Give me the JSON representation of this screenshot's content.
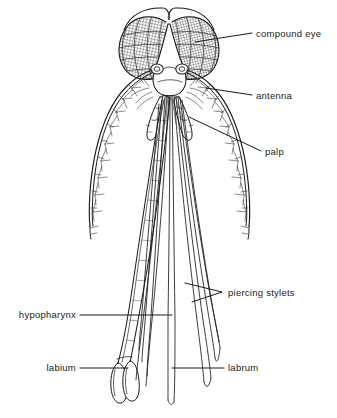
{
  "figure": {
    "background_color": "#ffffff",
    "ink_color": "#1a1a1a",
    "width": 337,
    "height": 418
  },
  "labels": {
    "compound_eye": "compound eye",
    "antenna": "antenna",
    "palp": "palp",
    "piercing_stylets": "piercing stylets",
    "hypopharynx": "hypopharynx",
    "labium": "labium",
    "labrum": "labrum"
  },
  "parts": [
    {
      "key": "compound_eye",
      "label": "compound eye",
      "side": "right",
      "text_x": 256,
      "text_y": 37,
      "align": "start"
    },
    {
      "key": "antenna",
      "label": "antenna",
      "side": "right",
      "text_x": 256,
      "text_y": 99,
      "align": "start"
    },
    {
      "key": "palp",
      "label": "palp",
      "side": "right",
      "text_x": 265,
      "text_y": 155,
      "align": "start"
    },
    {
      "key": "piercing_stylets",
      "label": "piercing stylets",
      "side": "right",
      "text_x": 228,
      "text_y": 295,
      "align": "start"
    },
    {
      "key": "hypopharynx",
      "label": "hypopharynx",
      "side": "left",
      "text_x": 76,
      "text_y": 318,
      "align": "end"
    },
    {
      "key": "labium",
      "label": "labium",
      "side": "left",
      "text_x": 76,
      "text_y": 371,
      "align": "end"
    },
    {
      "key": "labrum",
      "label": "labrum",
      "side": "right",
      "text_x": 228,
      "text_y": 371,
      "align": "start"
    }
  ]
}
